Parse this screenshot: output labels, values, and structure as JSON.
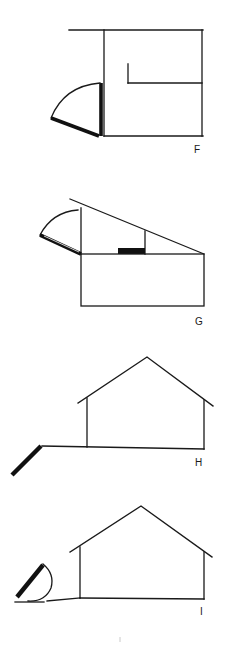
{
  "figure": {
    "panels": [
      {
        "id": "F",
        "label": "F",
        "description": "Plan view: building with door swinging outward on hinge"
      },
      {
        "id": "G",
        "label": "G",
        "description": "Plan view: angled wall with door swing and solid block"
      },
      {
        "id": "H",
        "label": "H",
        "description": "Elevation: gabled house with angled plank at left of ground line"
      },
      {
        "id": "I",
        "label": "I",
        "description": "Elevation: gabled house with half-disc/rocker object at left"
      }
    ],
    "colors": {
      "line": "#1a1a1a",
      "background": "#ffffff"
    }
  }
}
